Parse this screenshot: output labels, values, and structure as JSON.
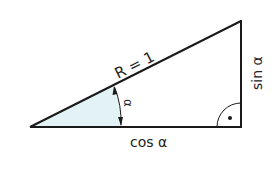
{
  "diagram": {
    "labels": {
      "hypotenuse": "R = 1",
      "adjacent": "cos α",
      "opposite": "sin α",
      "angle": "α"
    },
    "colors": {
      "stroke": "#1a1a1a",
      "angle_fill": "#e3f2f5",
      "background": "#ffffff"
    },
    "vertices": {
      "origin": [
        30,
        127
      ],
      "right_angle": [
        241,
        127
      ],
      "top": [
        241,
        21
      ]
    },
    "right_angle_marker": "arc-with-dot"
  }
}
